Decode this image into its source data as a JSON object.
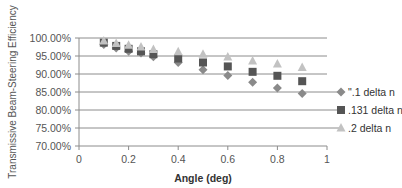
{
  "chart_data": {
    "type": "scatter",
    "title": "",
    "xlabel": "Angle (deg)",
    "ylabel": "Transmissive Beam-Steering Efficiency",
    "xlim": [
      0,
      1
    ],
    "ylim": [
      70,
      100
    ],
    "x_ticks": [
      "0",
      "0.2",
      "0.4",
      "0.6",
      "0.8",
      "1"
    ],
    "y_ticks": [
      "70.00%",
      "75.00%",
      "80.00%",
      "85.00%",
      "90.00%",
      "95.00%",
      "100.00%"
    ],
    "grid": "horizontal",
    "legend_position": "right",
    "x": [
      0.1,
      0.15,
      0.2,
      0.25,
      0.3,
      0.4,
      0.5,
      0.6,
      0.7,
      0.8,
      0.9
    ],
    "series": [
      {
        "name": "\".1 delta n",
        "marker": "diamond",
        "color": "#8a8a8a",
        "values": [
          98.2,
          97.2,
          96.3,
          95.8,
          94.8,
          93.2,
          91.2,
          89.6,
          87.7,
          86.1,
          84.6
        ]
      },
      {
        "name": ".131 delta n",
        "marker": "square",
        "color": "#555555",
        "values": [
          98.7,
          97.8,
          97.0,
          96.3,
          95.5,
          94.3,
          93.2,
          92.1,
          90.6,
          89.5,
          88.0
        ]
      },
      {
        "name": ".2 delta n",
        "marker": "triangle",
        "color": "#c2c2c2",
        "values": [
          99.2,
          98.5,
          98.0,
          97.5,
          96.8,
          96.2,
          95.5,
          94.7,
          93.6,
          92.8,
          91.8
        ]
      }
    ]
  }
}
